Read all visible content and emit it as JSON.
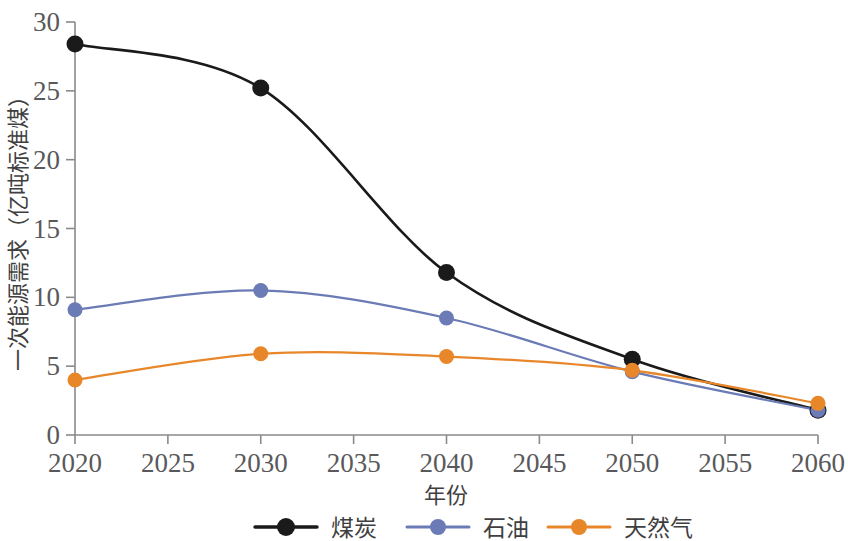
{
  "chart_data": {
    "type": "line",
    "title": "",
    "xlabel": "年份",
    "ylabel": "一次能源需求（亿吨标准煤）",
    "x": [
      2020,
      2030,
      2040,
      2050,
      2060
    ],
    "xticks": [
      2020,
      2025,
      2030,
      2035,
      2040,
      2045,
      2050,
      2055,
      2060
    ],
    "yticks": [
      0,
      5,
      10,
      15,
      20,
      25,
      30
    ],
    "xlim": [
      2020,
      2060
    ],
    "ylim": [
      0,
      30
    ],
    "grid": false,
    "legend_position": "bottom",
    "series": [
      {
        "name": "煤炭",
        "color": "#1a1a1a",
        "values": [
          28.4,
          25.2,
          11.8,
          5.5,
          1.8
        ]
      },
      {
        "name": "石油",
        "color": "#6b7bb5",
        "values": [
          9.1,
          10.5,
          8.5,
          4.6,
          1.8
        ]
      },
      {
        "name": "天然气",
        "color": "#e8872a",
        "values": [
          4.0,
          5.9,
          5.7,
          4.7,
          2.3
        ]
      }
    ]
  },
  "axis": {
    "y_tick_labels": [
      "30",
      "25",
      "20",
      "15",
      "10",
      "5",
      "0"
    ],
    "x_tick_labels": [
      "2020",
      "2025",
      "2030",
      "2035",
      "2040",
      "2045",
      "2050",
      "2055",
      "2060"
    ],
    "x_title": "年份",
    "y_title": "一次能源需求（亿吨标准煤）"
  },
  "legend": {
    "items": [
      {
        "label": "煤炭",
        "color": "#1a1a1a"
      },
      {
        "label": "石油",
        "color": "#6b7bb5"
      },
      {
        "label": "天然气",
        "color": "#e8872a"
      }
    ]
  },
  "colors": {
    "coal": "#1a1a1a",
    "oil": "#6b7bb5",
    "gas": "#e8872a",
    "axis": "#8a8a8c",
    "text": "#59595b",
    "background": "#ffffff"
  }
}
